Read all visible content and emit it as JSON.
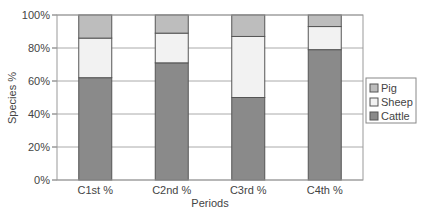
{
  "chart_data": {
    "type": "bar",
    "stacked": true,
    "percent": true,
    "title": "",
    "xlabel": "Periods",
    "ylabel": "Species %",
    "ylim": [
      0,
      100
    ],
    "yticks": [
      "0%",
      "20%",
      "40%",
      "60%",
      "80%",
      "100%"
    ],
    "grid": true,
    "legend_position": "right",
    "categories": [
      "C1st %",
      "C2nd %",
      "C3rd %",
      "C4th %"
    ],
    "series": [
      {
        "name": "Cattle",
        "color": "#8a8a8a",
        "values": [
          62,
          71,
          50,
          79
        ]
      },
      {
        "name": "Sheep",
        "color": "#f2f2f2",
        "values": [
          24,
          18,
          37,
          14
        ]
      },
      {
        "name": "Pig",
        "color": "#bdbdbd",
        "values": [
          14,
          11,
          13,
          7
        ]
      }
    ],
    "legend": [
      "Pig",
      "Sheep",
      "Cattle"
    ]
  }
}
